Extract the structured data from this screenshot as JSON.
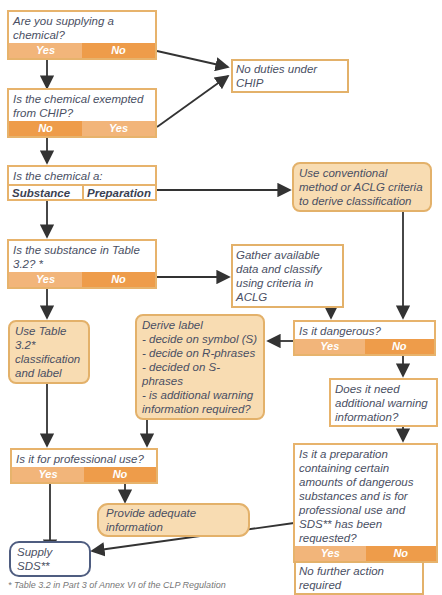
{
  "flowchart": {
    "q1": {
      "text": "Are you supplying a chemical?",
      "yes": "Yes",
      "no": "No"
    },
    "no_duties": "No duties under CHIP",
    "q2": {
      "text": "Is the chemical exempted from CHIP?",
      "no": "No",
      "yes": "Yes"
    },
    "q3": {
      "text": "Is the chemical a:",
      "opt1": "Substance",
      "opt2": "Preparation"
    },
    "conventional": "Use conventional method or ACLG criteria to derive classification",
    "q4": {
      "text": "Is the substance in Table 3.2? *",
      "yes": "Yes",
      "no": "No"
    },
    "gather": "Gather available data and classify using criteria in ACLG",
    "use_table": "Use Table 3.2* classification and label",
    "derive": {
      "title": "Derive label",
      "items": [
        "- decide on symbol (S)",
        "- decide on R-phrases",
        "- decided on S-phrases",
        "- is additional warning information required?"
      ]
    },
    "q5": {
      "text": "Is it dangerous?",
      "yes": "Yes",
      "no": "No"
    },
    "q6": {
      "text": "Does it need additional warning information?"
    },
    "q7": {
      "text": "Is it for professional use?",
      "yes": "Yes",
      "no": "No"
    },
    "provide": "Provide adequate information",
    "q8": {
      "text": "Is it a preparation containing certain amounts of dangerous substances and is for professional use and SDS** has been requested?",
      "yes": "Yes",
      "no": "No"
    },
    "supply_sds": "Supply SDS**",
    "no_further": "No further action required",
    "footnote": "* Table 3.2 in Part 3 of Annex VI of the CLP Regulation"
  },
  "colors": {
    "border": "#e7b36c",
    "answer_light": "#f2b57a",
    "answer_dark": "#ee9c4a",
    "action_fill": "#f8dcb2",
    "sds_border": "#4f5d80",
    "arrow": "#333333"
  }
}
